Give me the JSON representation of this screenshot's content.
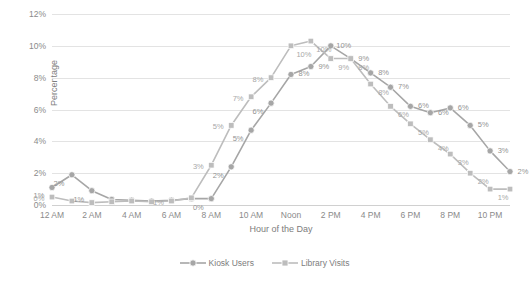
{
  "chart_data": {
    "type": "line",
    "title": "",
    "xlabel": "Hour of the Day",
    "ylabel": "Percentage",
    "ylim": [
      0,
      12
    ],
    "yticks": [
      "0%",
      "2%",
      "4%",
      "6%",
      "8%",
      "10%",
      "12%"
    ],
    "grid": true,
    "legend_position": "bottom",
    "x": [
      0,
      1,
      2,
      3,
      4,
      5,
      6,
      7,
      8,
      9,
      10,
      11,
      12,
      13,
      14,
      15,
      16,
      17,
      18,
      19,
      20,
      21,
      22,
      23
    ],
    "categories": [
      "12 AM",
      "1 AM",
      "2 AM",
      "3 AM",
      "4 AM",
      "5 AM",
      "6 AM",
      "7 AM",
      "8 AM",
      "9 AM",
      "10 AM",
      "11 AM",
      "Noon",
      "1 PM",
      "2 PM",
      "3 PM",
      "4 PM",
      "5 PM",
      "6 PM",
      "7 PM",
      "8 PM",
      "9 PM",
      "10 PM",
      "11 PM"
    ],
    "xtick_labels": [
      "12 AM",
      "2 AM",
      "4 AM",
      "6 AM",
      "8 AM",
      "10 AM",
      "Noon",
      "2 PM",
      "4 PM",
      "6 PM",
      "8 PM",
      "10 PM"
    ],
    "xtick_indices": [
      0,
      2,
      4,
      6,
      8,
      10,
      12,
      14,
      16,
      18,
      20,
      22
    ],
    "series": [
      {
        "name": "Kiosk Users",
        "marker": "circle",
        "color": "#a6a6a6",
        "values": [
          1.1,
          1.9,
          0.9,
          0.35,
          0.3,
          0.25,
          0.3,
          0.4,
          0.4,
          2.4,
          4.7,
          6.4,
          8.2,
          8.7,
          10.0,
          9.2,
          8.3,
          7.4,
          6.2,
          5.8,
          6.1,
          5.0,
          3.4,
          2.1
        ],
        "labels": [
          "1%",
          "2%",
          "1%",
          "",
          "",
          "",
          "",
          "",
          "0%",
          "2%",
          "5%",
          "6%",
          "8%",
          "9%",
          "10%",
          "9%",
          "8%",
          "7%",
          "6%",
          "6%",
          "6%",
          "5%",
          "3%",
          "2%"
        ]
      },
      {
        "name": "Library Visits",
        "marker": "square",
        "color": "#bdbdbd",
        "values": [
          0.5,
          0.25,
          0.15,
          0.2,
          0.25,
          0.2,
          0.25,
          0.45,
          2.5,
          5.0,
          6.8,
          8.0,
          10.0,
          10.3,
          9.2,
          9.2,
          7.6,
          6.2,
          5.1,
          4.1,
          3.2,
          2.0,
          1.0,
          1.0
        ],
        "labels": [
          "0%",
          "",
          "",
          "",
          "",
          "",
          "1%",
          "",
          "3%",
          "5%",
          "7%",
          "8%",
          "10%",
          "10%",
          "9%",
          "8%",
          "8%",
          "6%",
          "5%",
          "4%",
          "3%",
          "2%",
          "1%",
          ""
        ]
      }
    ]
  },
  "legend": {
    "items": [
      {
        "label": "Kiosk Users",
        "marker": "circle-marker",
        "color": "#a6a6a6"
      },
      {
        "label": "Library Visits",
        "marker": "square-marker",
        "color": "#bdbdbd"
      }
    ]
  }
}
